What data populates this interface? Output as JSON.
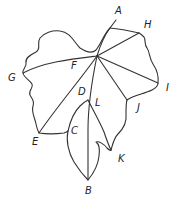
{
  "diagram": {
    "stroke_color": "#333333",
    "label_color": "#222222",
    "labels": {
      "A": "A",
      "B": "B",
      "C": "C",
      "D": "D",
      "E": "E",
      "F": "F",
      "G": "G",
      "H": "H",
      "I": "I",
      "J": "J",
      "K": "K",
      "L": "L"
    },
    "veins": [
      {
        "from": "A",
        "to": "F-center",
        "name": "stem-vein"
      },
      {
        "from": "F-center",
        "to": "H"
      },
      {
        "from": "F-center",
        "to": "G"
      },
      {
        "from": "F-center",
        "to": "I"
      },
      {
        "from": "F-center",
        "to": "J"
      },
      {
        "from": "F-center",
        "to": "E"
      },
      {
        "from": "F-center",
        "to": "B"
      },
      {
        "from": "A",
        "to": "H"
      }
    ]
  }
}
